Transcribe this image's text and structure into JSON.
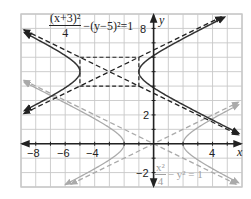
{
  "chart_data": {
    "type": "line",
    "title": "",
    "xlabel": "x",
    "ylabel": "y",
    "xlim": [
      -9,
      6
    ],
    "ylim": [
      -3,
      9
    ],
    "grid": true,
    "x_tick_labels": [
      "-8",
      "-6",
      "-4",
      "4"
    ],
    "y_tick_labels": [
      "8",
      "2",
      "-2"
    ],
    "series": [
      {
        "name": "(x+3)^2/4 - (y-5)^2 = 1",
        "kind": "hyperbola",
        "center": [
          -3,
          5
        ],
        "a": 2,
        "b": 1,
        "style": "solid",
        "color": "#333333",
        "vertices": [
          [
            -5,
            5
          ],
          [
            -1,
            5
          ]
        ],
        "asymptotes": [
          "y - 5 = (x+3)/2",
          "y - 5 = -(x+3)/2"
        ],
        "asymptote_style": "dashed",
        "box": {
          "x": [
            -5,
            -1
          ],
          "y": [
            4,
            6
          ]
        }
      },
      {
        "name": "x^2/4 - y^2 = 1",
        "kind": "hyperbola",
        "center": [
          0,
          0
        ],
        "a": 2,
        "b": 1,
        "style": "solid",
        "color": "#aaaaaa",
        "vertices": [
          [
            -2,
            0
          ],
          [
            2,
            0
          ]
        ],
        "asymptotes": [
          "y = x/2",
          "y = -x/2"
        ],
        "asymptote_style": "dashed"
      }
    ],
    "annotations": [
      {
        "text": "(x+3)^2/4 - (y-5)^2 = 1",
        "position": "top"
      },
      {
        "text": "x^2/4 - y^2 = 1",
        "position": "bottom-right"
      }
    ]
  },
  "labels": {
    "x_axis": "x",
    "y_axis": "y",
    "ticks_x": {
      "m8": "−8",
      "m6": "−6",
      "m4": "−4",
      "p4": "4"
    },
    "ticks_y": {
      "p8": "8",
      "p2": "2",
      "m2": "−2"
    },
    "eq_top": {
      "num": "(x+3)²",
      "den": "4",
      "rest": "−(y−5)²=1"
    },
    "eq_bottom": {
      "num": "x²",
      "den": "4",
      "rest": "− y² = 1"
    }
  },
  "colors": {
    "grid": "#c8c8c8",
    "axis": "#222222",
    "main_curve": "#333333",
    "secondary_curve": "#aaaaaa"
  }
}
